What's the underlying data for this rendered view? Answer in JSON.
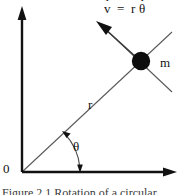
{
  "figure": {
    "domain": "diagram",
    "background_color": "#ffffff",
    "ink_color": "#111111"
  },
  "axes": {
    "origin_label": "0",
    "origin_point": [
      22,
      172
    ],
    "x_axis": {
      "from": [
        22,
        172
      ],
      "to": [
        176,
        172
      ],
      "arrowhead": "right"
    },
    "y_axis": {
      "from": [
        22,
        172
      ],
      "to": [
        22,
        8
      ],
      "arrowhead": "up"
    },
    "axis_color": "#111111",
    "axis_width": 2.2
  },
  "radius": {
    "label": "r",
    "from": [
      22,
      172
    ],
    "to": [
      141,
      61
    ],
    "extends_past_mass_to": [
      172,
      32
    ],
    "line_color": "#5a5a5a",
    "line_width": 1.1
  },
  "angle": {
    "label": "θ",
    "arc_center": [
      22,
      172
    ],
    "arc_radius": 58,
    "start_deg": 0,
    "end_deg": 43,
    "arrowheads": "both"
  },
  "mass": {
    "label": "m",
    "center": [
      141,
      61
    ],
    "radius": 9,
    "fill": "#0d0d0d"
  },
  "velocity": {
    "equation_tokens": [
      {
        "text": "v",
        "dot": true
      },
      {
        "text": "=",
        "dot": false,
        "operator": true
      },
      {
        "text": "r",
        "dot": false
      },
      {
        "text": "θ",
        "dot": true
      }
    ],
    "equation_plain": "v̇ = r θ̇",
    "arrow_from": [
      141,
      61
    ],
    "arrow_to": [
      99,
      23
    ],
    "tail_extends_to": [
      172,
      92
    ],
    "arrowhead": "up-left",
    "line_color": "#5a5a5a",
    "line_width": 1.1
  },
  "caption": {
    "text": "Figure 2.1   Rotation of a circular"
  }
}
